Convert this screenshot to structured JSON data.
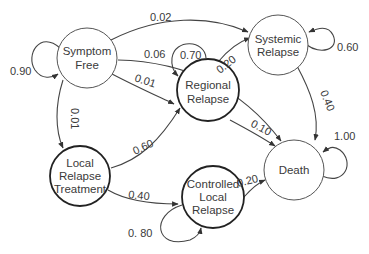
{
  "diagram": {
    "type": "state-transition",
    "nodes": [
      {
        "id": "symptom_free",
        "lines": [
          "Symptom",
          "Free"
        ]
      },
      {
        "id": "systemic_relapse",
        "lines": [
          "Systemic",
          "Relapse"
        ]
      },
      {
        "id": "regional_relapse",
        "lines": [
          "Regional",
          "Relapse"
        ]
      },
      {
        "id": "local_relapse_treatment",
        "lines": [
          "Local",
          "Relapse",
          "Treatment"
        ]
      },
      {
        "id": "controlled_local_relapse",
        "lines": [
          "Controlled",
          "Local",
          "Relapse"
        ]
      },
      {
        "id": "death",
        "lines": [
          "Death"
        ]
      }
    ],
    "edges": [
      {
        "from": "symptom_free",
        "to": "symptom_free",
        "label": "0.90"
      },
      {
        "from": "symptom_free",
        "to": "systemic_relapse",
        "label": "0.02"
      },
      {
        "from": "symptom_free",
        "to": "death",
        "label": "0.06"
      },
      {
        "from": "symptom_free",
        "to": "regional_relapse",
        "label": "0.01"
      },
      {
        "from": "symptom_free",
        "to": "local_relapse_treatment",
        "label": "0.01"
      },
      {
        "from": "regional_relapse",
        "to": "regional_relapse",
        "label": "0.70"
      },
      {
        "from": "regional_relapse",
        "to": "systemic_relapse",
        "label": "0.20"
      },
      {
        "from": "regional_relapse",
        "to": "death",
        "label": "0.10"
      },
      {
        "from": "systemic_relapse",
        "to": "systemic_relapse",
        "label": "0.60"
      },
      {
        "from": "systemic_relapse",
        "to": "death",
        "label": "0.40"
      },
      {
        "from": "local_relapse_treatment",
        "to": "regional_relapse",
        "label": "0.60"
      },
      {
        "from": "local_relapse_treatment",
        "to": "controlled_local_relapse",
        "label": "0.40"
      },
      {
        "from": "controlled_local_relapse",
        "to": "controlled_local_relapse",
        "label": "0. 80"
      },
      {
        "from": "controlled_local_relapse",
        "to": "death",
        "label": "0.20"
      },
      {
        "from": "death",
        "to": "death",
        "label": "1.00"
      }
    ]
  }
}
